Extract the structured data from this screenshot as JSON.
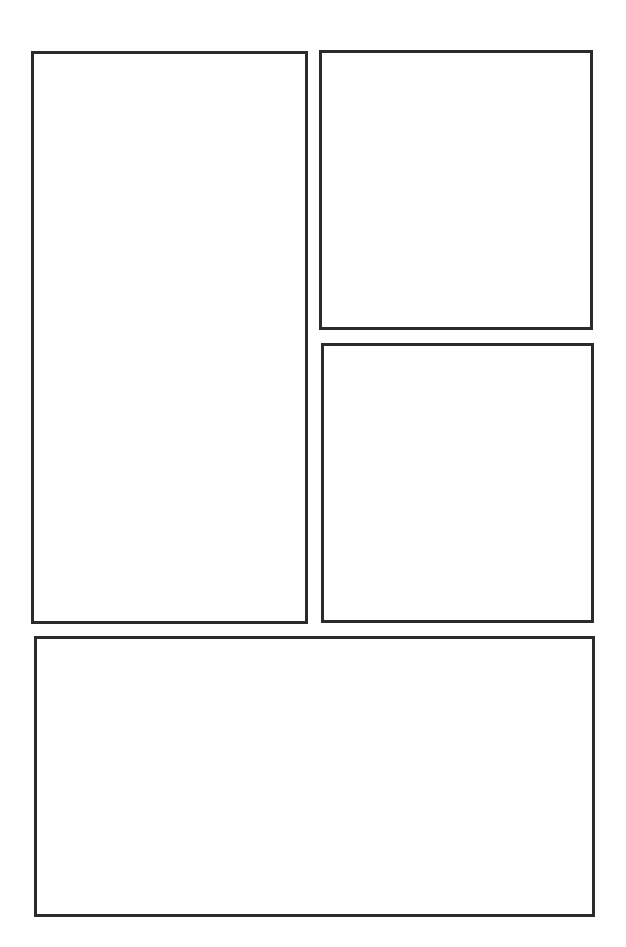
{
  "page": {
    "type": "comic-panel-template",
    "background": "#ffffff",
    "border_color": "#2b2b2b",
    "panels": [
      {
        "id": "panel-1",
        "position": "left-tall",
        "x": 31,
        "y": 51,
        "width": 277,
        "height": 573
      },
      {
        "id": "panel-2",
        "position": "top-right",
        "x": 319,
        "y": 50,
        "width": 274,
        "height": 280
      },
      {
        "id": "panel-3",
        "position": "middle-right",
        "x": 321,
        "y": 343,
        "width": 273,
        "height": 280
      },
      {
        "id": "panel-4",
        "position": "bottom-wide",
        "x": 34,
        "y": 636,
        "width": 561,
        "height": 281
      }
    ]
  }
}
